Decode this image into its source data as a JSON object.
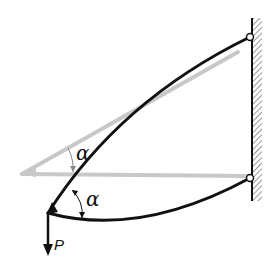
{
  "diagram": {
    "title": "",
    "labels": {
      "angle_upper": "α",
      "angle_lower": "α",
      "load": "P"
    },
    "colors": {
      "background": "#ffffff",
      "deformed_member": "#111111",
      "undeformed_member": "#c8c8c8",
      "wall_hatch": "#555555"
    },
    "elements": [
      {
        "id": "wall",
        "type": "fixed-wall",
        "side": "right"
      },
      {
        "id": "pin-top",
        "type": "pin-support"
      },
      {
        "id": "pin-bottom",
        "type": "pin-support"
      },
      {
        "id": "upper-member-undeformed",
        "type": "straight-bar",
        "style": "gray"
      },
      {
        "id": "lower-member-undeformed",
        "type": "straight-bar",
        "style": "gray"
      },
      {
        "id": "upper-member-deformed",
        "type": "curved-bar",
        "style": "black"
      },
      {
        "id": "lower-member-deformed",
        "type": "curved-bar",
        "style": "black"
      },
      {
        "id": "joint",
        "type": "rigid-joint"
      },
      {
        "id": "load-arrow",
        "type": "force",
        "direction": "down",
        "label": "P"
      }
    ]
  }
}
